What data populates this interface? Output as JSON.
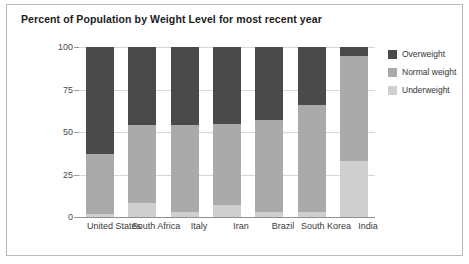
{
  "chart_title": "Percent of Population by Weight Level for most recent year",
  "legend": {
    "items": [
      {
        "label": "Overweight",
        "color": "#4a4a4a"
      },
      {
        "label": "Normal weight",
        "color": "#aaaaaa"
      },
      {
        "label": "Underweight",
        "color": "#cfcfcf"
      }
    ]
  },
  "axis": {
    "y_ticks": [
      "0",
      "25",
      "50",
      "75",
      "100"
    ]
  },
  "chart_data": {
    "type": "bar",
    "stacked": true,
    "title": "Percent of Population by Weight Level for most recent year",
    "xlabel": "",
    "ylabel": "",
    "ylim": [
      0,
      100
    ],
    "yticks": [
      0,
      25,
      50,
      75,
      100
    ],
    "grid": true,
    "legend_position": "right",
    "categories": [
      "United States",
      "South Africa",
      "Italy",
      "Iran",
      "Brazil",
      "South Korea",
      "India"
    ],
    "series": [
      {
        "name": "Underweight",
        "color": "#cfcfcf",
        "values": [
          2,
          8,
          3,
          7,
          3,
          3,
          33
        ]
      },
      {
        "name": "Normal weight",
        "color": "#aaaaaa",
        "values": [
          35,
          46,
          51,
          48,
          54,
          63,
          62
        ]
      },
      {
        "name": "Overweight",
        "color": "#4a4a4a",
        "values": [
          63,
          46,
          46,
          45,
          43,
          34,
          5
        ]
      }
    ]
  }
}
